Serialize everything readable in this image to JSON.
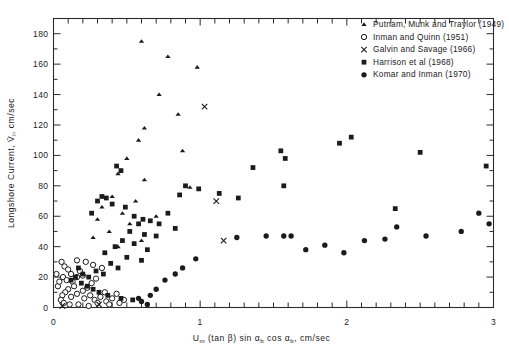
{
  "chart_data": {
    "type": "scatter",
    "title": "",
    "xlabel": "Uₘ (tan β) sin αₕ cos αₕ, cm/sec",
    "ylabel": "Longshore Current, V̄ₗ, cm/sec",
    "xlim": [
      0,
      3
    ],
    "ylim": [
      0,
      190
    ],
    "xticks": [
      0,
      1,
      2,
      3
    ],
    "xticklabels": [
      "0",
      "1",
      "2",
      "3"
    ],
    "xminor_step": 0.1,
    "yticks": [
      0,
      20,
      40,
      60,
      80,
      100,
      120,
      140,
      160,
      180
    ],
    "yticklabels": [
      "0",
      "20",
      "40",
      "60",
      "80",
      "100",
      "120",
      "140",
      "160",
      "180"
    ],
    "grid": false,
    "legend_position": "top-right",
    "series": [
      {
        "name": "Putnam, Munk and Traylor (1949)",
        "marker": "triangle",
        "color": "#1b1b1b",
        "points": [
          [
            0.6,
            175
          ],
          [
            0.78,
            165
          ],
          [
            0.98,
            158
          ],
          [
            0.72,
            140
          ],
          [
            0.85,
            127
          ],
          [
            0.62,
            118
          ],
          [
            0.58,
            110
          ],
          [
            0.88,
            103
          ],
          [
            0.5,
            98
          ],
          [
            0.44,
            88
          ],
          [
            0.62,
            84
          ],
          [
            0.93,
            79
          ],
          [
            0.4,
            73
          ],
          [
            0.56,
            70
          ],
          [
            0.33,
            66
          ],
          [
            0.47,
            62
          ],
          [
            0.7,
            60
          ],
          [
            0.3,
            58
          ],
          [
            0.52,
            55
          ],
          [
            0.38,
            50
          ],
          [
            0.27,
            46
          ],
          [
            0.6,
            44
          ],
          [
            0.44,
            40
          ],
          [
            0.35,
            36
          ]
        ]
      },
      {
        "name": "Inman and Quinn (1951)",
        "marker": "circle-open",
        "color": "#1b1b1b",
        "points": [
          [
            0.055,
            30
          ],
          [
            0.075,
            27
          ],
          [
            0.1,
            25
          ],
          [
            0.12,
            22
          ],
          [
            0.065,
            20
          ],
          [
            0.09,
            18
          ],
          [
            0.13,
            17
          ],
          [
            0.16,
            20
          ],
          [
            0.18,
            24
          ],
          [
            0.2,
            21
          ],
          [
            0.14,
            14
          ],
          [
            0.1,
            12
          ],
          [
            0.08,
            10
          ],
          [
            0.06,
            8
          ],
          [
            0.12,
            7
          ],
          [
            0.16,
            9
          ],
          [
            0.2,
            11
          ],
          [
            0.23,
            13
          ],
          [
            0.26,
            16
          ],
          [
            0.29,
            19
          ],
          [
            0.21,
            6
          ],
          [
            0.25,
            8
          ],
          [
            0.28,
            5
          ],
          [
            0.32,
            7
          ],
          [
            0.35,
            10
          ],
          [
            0.3,
            3
          ],
          [
            0.36,
            4
          ],
          [
            0.4,
            6
          ],
          [
            0.43,
            9
          ],
          [
            0.38,
            2
          ],
          [
            0.45,
            3
          ],
          [
            0.48,
            5
          ],
          [
            0.05,
            5
          ],
          [
            0.07,
            3
          ],
          [
            0.03,
            14
          ],
          [
            0.04,
            17
          ],
          [
            0.02,
            22
          ],
          [
            0.16,
            31
          ],
          [
            0.22,
            30
          ],
          [
            0.27,
            28
          ],
          [
            0.33,
            26
          ],
          [
            0.17,
            2
          ],
          [
            0.24,
            1
          ],
          [
            0.11,
            2
          ]
        ]
      },
      {
        "name": "Galvin and Savage (1966)",
        "marker": "x",
        "color": "#1b1b1b",
        "points": [
          [
            1.03,
            132
          ],
          [
            1.11,
            70
          ],
          [
            1.16,
            44
          ],
          [
            0.31,
            2
          ],
          [
            0.06,
            1
          ]
        ]
      },
      {
        "name": "Harrison et al (1968)",
        "marker": "square",
        "color": "#1b1b1b",
        "points": [
          [
            0.43,
            93
          ],
          [
            0.46,
            90
          ],
          [
            0.33,
            73
          ],
          [
            0.36,
            72
          ],
          [
            0.3,
            70
          ],
          [
            0.4,
            68
          ],
          [
            0.49,
            66
          ],
          [
            0.26,
            62
          ],
          [
            0.55,
            60
          ],
          [
            0.61,
            58
          ],
          [
            0.58,
            55
          ],
          [
            0.66,
            57
          ],
          [
            0.72,
            55
          ],
          [
            0.52,
            50
          ],
          [
            0.62,
            48
          ],
          [
            0.7,
            47
          ],
          [
            0.47,
            44
          ],
          [
            0.55,
            42
          ],
          [
            0.42,
            40
          ],
          [
            0.64,
            38
          ],
          [
            0.35,
            36
          ],
          [
            0.5,
            33
          ],
          [
            0.6,
            31
          ],
          [
            0.39,
            29
          ],
          [
            0.44,
            26
          ],
          [
            0.29,
            24
          ],
          [
            0.34,
            22
          ],
          [
            0.24,
            20
          ],
          [
            0.2,
            22
          ],
          [
            0.17,
            26
          ],
          [
            0.15,
            20
          ],
          [
            0.12,
            18
          ],
          [
            0.19,
            16
          ],
          [
            0.23,
            14
          ],
          [
            0.27,
            12
          ],
          [
            0.31,
            10
          ],
          [
            0.37,
            8
          ],
          [
            0.46,
            6
          ],
          [
            0.54,
            5
          ],
          [
            0.9,
            80
          ],
          [
            0.99,
            78
          ],
          [
            1.13,
            75
          ],
          [
            1.26,
            72
          ],
          [
            1.36,
            92
          ],
          [
            1.55,
            103
          ],
          [
            1.58,
            98
          ],
          [
            1.95,
            108
          ],
          [
            2.03,
            112
          ],
          [
            2.5,
            102
          ],
          [
            2.33,
            65
          ],
          [
            2.95,
            93
          ],
          [
            1.57,
            80
          ],
          [
            0.86,
            74
          ],
          [
            0.78,
            62
          ],
          [
            0.83,
            52
          ]
        ]
      },
      {
        "name": "Komar and Inman (1970)",
        "marker": "circle-filled",
        "color": "#1b1b1b",
        "points": [
          [
            1.25,
            46
          ],
          [
            0.97,
            32
          ],
          [
            0.88,
            26
          ],
          [
            0.83,
            22
          ],
          [
            0.76,
            18
          ],
          [
            0.7,
            12
          ],
          [
            0.66,
            8
          ],
          [
            1.45,
            47
          ],
          [
            1.57,
            47
          ],
          [
            1.62,
            47
          ],
          [
            1.72,
            38
          ],
          [
            1.85,
            41
          ],
          [
            1.98,
            36
          ],
          [
            2.12,
            44
          ],
          [
            2.26,
            45
          ],
          [
            2.34,
            53
          ],
          [
            2.54,
            47
          ],
          [
            2.78,
            50
          ],
          [
            2.9,
            62
          ],
          [
            2.97,
            55
          ],
          [
            0.6,
            4
          ],
          [
            0.64,
            2
          ],
          [
            0.58,
            6
          ]
        ]
      }
    ]
  },
  "axes": {
    "ylabel_text": "Longshore Current,",
    "ylabel_symbol": "V",
    "ylabel_sub": "l",
    "ylabel_units": ", cm/sec",
    "xlabel_u": "U",
    "xlabel_u_sub": "m",
    "xlabel_mid": " (tan β) sin α",
    "xlabel_b1": "b",
    "xlabel_mid2": " cos α",
    "xlabel_b2": "b",
    "xlabel_units": ", cm/sec"
  },
  "legend": {
    "items": [
      {
        "marker": "triangle",
        "label": "Putnam, Munk and Traylor (1949)"
      },
      {
        "marker": "circle-open",
        "label": "Inman and Quinn (1951)"
      },
      {
        "marker": "x",
        "label": "Galvin and  Savage (1966)"
      },
      {
        "marker": "square",
        "label": "Harrison  et al (1968)"
      },
      {
        "marker": "circle-filled",
        "label": "Komar and Inman (1970)"
      }
    ]
  }
}
